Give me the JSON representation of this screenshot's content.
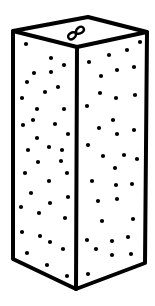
{
  "illustration": {
    "subject": "speckled rectangular prism (tall box) with infinity symbol on top",
    "colors": {
      "background": "#ffffff",
      "stroke": "#000000",
      "dots": "#000000"
    },
    "stroke_width": 4,
    "vertices": {
      "top_back": [
        88,
        17
      ],
      "top_left": [
        13,
        31
      ],
      "top_right": [
        147,
        32
      ],
      "top_front": [
        77,
        47
      ],
      "bottom_left": [
        13,
        259
      ],
      "bottom_right": [
        145,
        263
      ],
      "bottom_front": [
        76,
        289
      ]
    },
    "top_symbol": {
      "icon": "infinity-icon",
      "glyph": "∞",
      "center": [
        76,
        33
      ],
      "rotation_deg": -35
    },
    "left_face_dots": [
      [
        26,
        44
      ],
      [
        51,
        58
      ],
      [
        64,
        65
      ],
      [
        34,
        73
      ],
      [
        51,
        72
      ],
      [
        27,
        82
      ],
      [
        45,
        92
      ],
      [
        58,
        87
      ],
      [
        22,
        98
      ],
      [
        37,
        109
      ],
      [
        64,
        109
      ],
      [
        33,
        120
      ],
      [
        23,
        125
      ],
      [
        55,
        124
      ],
      [
        68,
        134
      ],
      [
        37,
        138
      ],
      [
        49,
        147
      ],
      [
        28,
        150
      ],
      [
        62,
        150
      ],
      [
        38,
        162
      ],
      [
        61,
        161
      ],
      [
        25,
        173
      ],
      [
        49,
        181
      ],
      [
        67,
        173
      ],
      [
        31,
        193
      ],
      [
        21,
        207
      ],
      [
        50,
        203
      ],
      [
        39,
        213
      ],
      [
        68,
        197
      ],
      [
        65,
        218
      ],
      [
        22,
        232
      ],
      [
        40,
        236
      ],
      [
        50,
        242
      ],
      [
        63,
        249
      ],
      [
        27,
        253
      ],
      [
        47,
        265
      ],
      [
        67,
        276
      ]
    ],
    "right_face_dots": [
      [
        140,
        42
      ],
      [
        127,
        50
      ],
      [
        109,
        55
      ],
      [
        89,
        62
      ],
      [
        117,
        70
      ],
      [
        134,
        67
      ],
      [
        101,
        76
      ],
      [
        100,
        93
      ],
      [
        116,
        98
      ],
      [
        135,
        95
      ],
      [
        87,
        106
      ],
      [
        113,
        120
      ],
      [
        99,
        128
      ],
      [
        117,
        134
      ],
      [
        134,
        130
      ],
      [
        88,
        145
      ],
      [
        103,
        156
      ],
      [
        124,
        155
      ],
      [
        137,
        159
      ],
      [
        115,
        168
      ],
      [
        92,
        181
      ],
      [
        116,
        185
      ],
      [
        132,
        184
      ],
      [
        98,
        201
      ],
      [
        117,
        199
      ],
      [
        102,
        221
      ],
      [
        133,
        219
      ],
      [
        87,
        240
      ],
      [
        112,
        241
      ],
      [
        128,
        237
      ],
      [
        96,
        249
      ],
      [
        112,
        255
      ],
      [
        131,
        254
      ],
      [
        88,
        274
      ]
    ]
  }
}
